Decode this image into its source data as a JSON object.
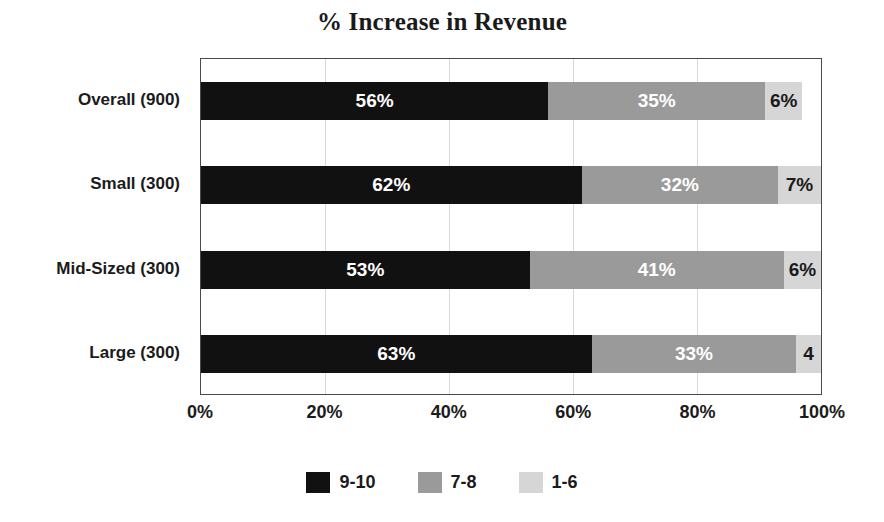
{
  "chart_data": {
    "type": "bar",
    "subtype": "stacked-horizontal-100",
    "title": "% Increase in Revenue",
    "xlabel": "",
    "ylabel": "",
    "xlim": [
      0,
      100
    ],
    "grid": true,
    "grid_axis": "x",
    "legend_position": "bottom",
    "categories": [
      "Overall (900)",
      "Small (300)",
      "Mid-Sized (300)",
      "Large (300)"
    ],
    "series": [
      {
        "name": "9-10",
        "color": "#111111",
        "values": [
          56,
          62,
          53,
          63
        ],
        "labels": [
          "56%",
          "62%",
          "53%",
          "63%"
        ]
      },
      {
        "name": "7-8",
        "color": "#9a9a9a",
        "values": [
          35,
          32,
          41,
          33
        ],
        "labels": [
          "35%",
          "32%",
          "41%",
          "33%"
        ]
      },
      {
        "name": "1-6",
        "color": "#d6d6d6",
        "values": [
          6,
          7,
          6,
          4
        ],
        "labels": [
          "6%",
          "7%",
          "6%",
          "4"
        ]
      }
    ],
    "xticks": [
      0,
      20,
      40,
      60,
      80,
      100
    ],
    "xticklabels": [
      "0%",
      "20%",
      "40%",
      "60%",
      "80%",
      "100%"
    ],
    "legend": [
      {
        "label": "9-10",
        "color": "#111111"
      },
      {
        "label": "7-8",
        "color": "#9a9a9a"
      },
      {
        "label": "1-6",
        "color": "#d6d6d6"
      }
    ]
  },
  "rows": [
    {
      "category": "Overall (900)",
      "segments": [
        {
          "series": "9-10",
          "value": 56,
          "label": "56%"
        },
        {
          "series": "7-8",
          "value": 35,
          "label": "35%"
        },
        {
          "series": "1-6",
          "value": 6,
          "label": "6%"
        }
      ]
    },
    {
      "category": "Small (300)",
      "segments": [
        {
          "series": "9-10",
          "value": 62,
          "label": "62%"
        },
        {
          "series": "7-8",
          "value": 32,
          "label": "32%"
        },
        {
          "series": "1-6",
          "value": 7,
          "label": "7%"
        }
      ]
    },
    {
      "category": "Mid-Sized (300)",
      "segments": [
        {
          "series": "9-10",
          "value": 53,
          "label": "53%"
        },
        {
          "series": "7-8",
          "value": 41,
          "label": "41%"
        },
        {
          "series": "1-6",
          "value": 6,
          "label": "6%"
        }
      ]
    },
    {
      "category": "Large (300)",
      "segments": [
        {
          "series": "9-10",
          "value": 63,
          "label": "63%"
        },
        {
          "series": "7-8",
          "value": 33,
          "label": "33%"
        },
        {
          "series": "1-6",
          "value": 4,
          "label": "4"
        }
      ]
    }
  ],
  "colors": {
    "series_9_10": "#111111",
    "series_7_8": "#9a9a9a",
    "series_1_6": "#d6d6d6",
    "frame": "#4a4a4a",
    "gridline": "#d9d9d9",
    "text": "#1b1b1b",
    "background": "#ffffff"
  }
}
